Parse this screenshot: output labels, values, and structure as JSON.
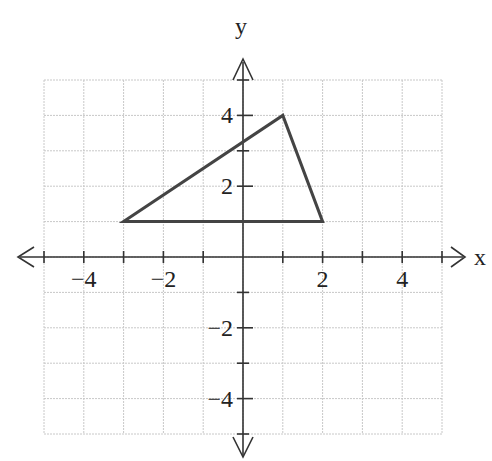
{
  "chart_data": {
    "type": "coordinate-plane",
    "title": "",
    "xlabel": "x",
    "ylabel": "y",
    "xlim": [
      -5,
      5
    ],
    "ylim": [
      -5,
      5
    ],
    "grid": true,
    "x_tick_labels": [
      "-4",
      "-2",
      "2",
      "4"
    ],
    "y_tick_labels": [
      "4",
      "2",
      "-2",
      "-4"
    ],
    "shapes": [
      {
        "type": "triangle",
        "vertices": [
          [
            -3,
            1
          ],
          [
            1,
            4
          ],
          [
            2,
            1
          ]
        ]
      }
    ]
  },
  "labels": {
    "x_axis": "x",
    "y_axis": "y",
    "x_ticks": [
      {
        "value": -4,
        "text": "−4"
      },
      {
        "value": -2,
        "text": "−2"
      },
      {
        "value": 2,
        "text": "2"
      },
      {
        "value": 4,
        "text": "4"
      }
    ],
    "y_ticks": [
      {
        "value": 4,
        "text": "4"
      },
      {
        "value": 2,
        "text": "2"
      },
      {
        "value": -2,
        "text": "−2"
      },
      {
        "value": -4,
        "text": "−4"
      }
    ]
  },
  "colors": {
    "grid": "#c8c8c8",
    "axis": "#333333",
    "shape": "#444444"
  }
}
